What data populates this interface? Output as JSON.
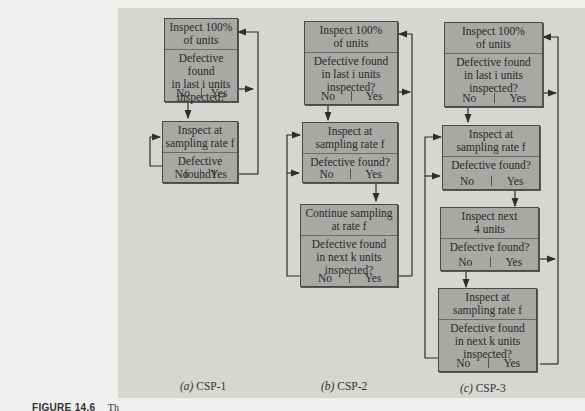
{
  "figure": {
    "label": "FIGURE 14.6",
    "caption_start": "Th"
  },
  "panels": [
    {
      "id": "csp1",
      "caption_letter": "(a)",
      "caption_text": "CSP-1",
      "boxes": [
        {
          "header": [
            "Inspect 100%",
            "of units"
          ],
          "question": [
            "Defective found",
            "in last i units",
            "inspected?"
          ],
          "no": "No",
          "yes": "Yes"
        },
        {
          "header": [
            "Inspect at",
            "sampling rate f"
          ],
          "question": [
            "Defective found?"
          ],
          "no": "No",
          "yes": "Yes"
        }
      ]
    },
    {
      "id": "csp2",
      "caption_letter": "(b)",
      "caption_text": "CSP-2",
      "boxes": [
        {
          "header": [
            "Inspect 100%",
            "of units"
          ],
          "question": [
            "Defective found",
            "in last i units",
            "inspected?"
          ],
          "no": "No",
          "yes": "Yes"
        },
        {
          "header": [
            "Inspect at",
            "sampling rate f"
          ],
          "question": [
            "Defective found?"
          ],
          "no": "No",
          "yes": "Yes"
        },
        {
          "header": [
            "Continue sampling",
            "at rate f"
          ],
          "question": [
            "Defective found",
            "in next k units",
            "inspected?"
          ],
          "no": "No",
          "yes": "Yes"
        }
      ]
    },
    {
      "id": "csp3",
      "caption_letter": "(c)",
      "caption_text": "CSP-3",
      "boxes": [
        {
          "header": [
            "Inspect 100%",
            "of units"
          ],
          "question": [
            "Defective found",
            "in last i units",
            "inspected?"
          ],
          "no": "No",
          "yes": "Yes"
        },
        {
          "header": [
            "Inspect at",
            "sampling rate f"
          ],
          "question": [
            "Defective found?"
          ],
          "no": "No",
          "yes": "Yes"
        },
        {
          "header": [
            "Inspect next",
            "4 units"
          ],
          "question": [
            "Defective found?"
          ],
          "no": "No",
          "yes": "Yes"
        },
        {
          "header": [
            "Inspect at",
            "sampling rate f"
          ],
          "question": [
            "Defective found",
            "in next k units",
            "inspected?"
          ],
          "no": "No",
          "yes": "Yes"
        }
      ]
    }
  ],
  "colors": {
    "panel_bg": "#d6d6d3",
    "box_fill": "#a8a8a5",
    "line": "#2e2e2e"
  }
}
